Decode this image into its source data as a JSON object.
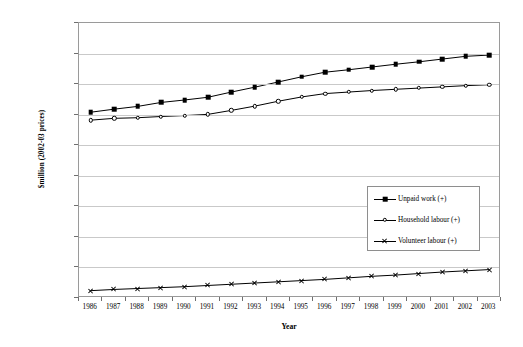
{
  "chart_data": {
    "type": "line",
    "title": "",
    "xlabel": "Year",
    "ylabel": "$million (2002-03 prices)",
    "x": [
      1986,
      1987,
      1988,
      1989,
      1990,
      1991,
      1992,
      1993,
      1994,
      1995,
      1996,
      1997,
      1998,
      1999,
      2000,
      2001,
      2002,
      2003
    ],
    "xtick_labels": [
      "1986",
      "1987",
      "1988",
      "1989",
      "1990",
      "1991",
      "1992",
      "1993",
      "1994",
      "1995",
      "1996",
      "1997",
      "1998",
      "1999",
      "2000",
      "2001",
      "2002",
      "2003"
    ],
    "ylim": [
      0,
      90000
    ],
    "ytick_values": [
      0,
      10000,
      20000,
      30000,
      40000,
      50000,
      60000,
      70000,
      80000,
      90000
    ],
    "ytick_labels": [
      "0.0",
      "10,000.0",
      "20,000.0",
      "30,000.0",
      "40,000.0",
      "50,000.0",
      "60,000.0",
      "70,000.0",
      "80,000.0",
      "90,000.0"
    ],
    "grid": true,
    "legend_position": "center",
    "series": [
      {
        "name": "Unpaid work (+)",
        "marker": "filled-square",
        "color": "#000000",
        "values": [
          60800,
          61800,
          62700,
          64000,
          64800,
          65700,
          67400,
          69000,
          70700,
          72400,
          73900,
          74700,
          75600,
          76500,
          77300,
          78200,
          79100,
          79500
        ]
      },
      {
        "name": "Household labour (+)",
        "marker": "open-circle",
        "color": "#000000",
        "values": [
          58200,
          58800,
          59000,
          59400,
          59700,
          60100,
          61400,
          62800,
          64400,
          65800,
          66900,
          67400,
          67900,
          68300,
          68700,
          69100,
          69500,
          69800
        ]
      },
      {
        "name": "Volunteer labour (+)",
        "marker": "x",
        "color": "#000000",
        "values": [
          2400,
          2800,
          3100,
          3400,
          3700,
          4100,
          4500,
          4900,
          5300,
          5700,
          6100,
          6600,
          7100,
          7500,
          8000,
          8500,
          8900,
          9300
        ]
      }
    ]
  },
  "legend": {
    "items": [
      {
        "label": "Unpaid work (+)"
      },
      {
        "label": "Household labour (+)"
      },
      {
        "label": "Volunteer labour (+)"
      }
    ]
  },
  "axes": {
    "x_title": "Year",
    "y_title": "$million (2002-03 prices)"
  }
}
